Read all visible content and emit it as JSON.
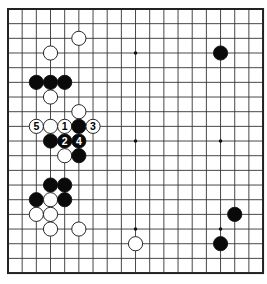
{
  "board": {
    "size": 19,
    "origin_x": 8,
    "origin_y": 9,
    "step_x": 14.17,
    "step_y": 14.67,
    "stone_radius": 7.1,
    "line_color": "#333333",
    "border_color": "#222222",
    "background": "#ffffff",
    "hoshi": [
      [
        3,
        3
      ],
      [
        9,
        3
      ],
      [
        15,
        3
      ],
      [
        3,
        9
      ],
      [
        9,
        9
      ],
      [
        15,
        9
      ],
      [
        3,
        15
      ],
      [
        9,
        15
      ],
      [
        15,
        15
      ]
    ]
  },
  "stones": [
    {
      "color": "white",
      "col": 5,
      "row": 2,
      "label": ""
    },
    {
      "color": "white",
      "col": 3,
      "row": 3,
      "label": ""
    },
    {
      "color": "black",
      "col": 15,
      "row": 3,
      "label": ""
    },
    {
      "color": "black",
      "col": 2,
      "row": 5,
      "label": ""
    },
    {
      "color": "black",
      "col": 3,
      "row": 5,
      "label": ""
    },
    {
      "color": "black",
      "col": 4,
      "row": 5,
      "label": ""
    },
    {
      "color": "white",
      "col": 3,
      "row": 6,
      "label": ""
    },
    {
      "color": "white",
      "col": 5,
      "row": 7,
      "label": ""
    },
    {
      "color": "white",
      "col": 2,
      "row": 8,
      "label": "5"
    },
    {
      "color": "white",
      "col": 3,
      "row": 8,
      "label": ""
    },
    {
      "color": "white",
      "col": 4,
      "row": 8,
      "label": "1"
    },
    {
      "color": "black",
      "col": 5,
      "row": 8,
      "label": ""
    },
    {
      "color": "white",
      "col": 6,
      "row": 8,
      "label": "3"
    },
    {
      "color": "black",
      "col": 3,
      "row": 9,
      "label": ""
    },
    {
      "color": "black",
      "col": 4,
      "row": 9,
      "label": "2"
    },
    {
      "color": "black",
      "col": 5,
      "row": 9,
      "label": "4"
    },
    {
      "color": "white",
      "col": 4,
      "row": 10,
      "label": ""
    },
    {
      "color": "black",
      "col": 5,
      "row": 10,
      "label": ""
    },
    {
      "color": "black",
      "col": 3,
      "row": 12,
      "label": ""
    },
    {
      "color": "black",
      "col": 4,
      "row": 12,
      "label": ""
    },
    {
      "color": "black",
      "col": 2,
      "row": 13,
      "label": ""
    },
    {
      "color": "white",
      "col": 3,
      "row": 13,
      "label": ""
    },
    {
      "color": "black",
      "col": 4,
      "row": 13,
      "label": ""
    },
    {
      "color": "white",
      "col": 2,
      "row": 14,
      "label": ""
    },
    {
      "color": "white",
      "col": 3,
      "row": 14,
      "label": ""
    },
    {
      "color": "black",
      "col": 16,
      "row": 14,
      "label": ""
    },
    {
      "color": "white",
      "col": 3,
      "row": 15,
      "label": ""
    },
    {
      "color": "white",
      "col": 5,
      "row": 15,
      "label": ""
    },
    {
      "color": "white",
      "col": 9,
      "row": 16,
      "label": ""
    },
    {
      "color": "black",
      "col": 15,
      "row": 16,
      "label": ""
    }
  ]
}
